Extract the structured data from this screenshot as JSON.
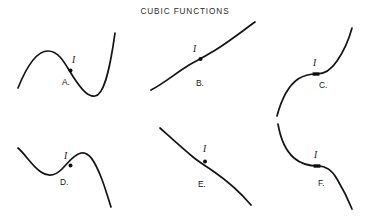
{
  "figure": {
    "title": "CUBIC FUNCTIONS",
    "title_x": 185,
    "title_y": 14,
    "background_color": "#ffffff",
    "stroke_color": "#141414",
    "panel_count": 6
  },
  "panels": [
    {
      "id": "A",
      "label": "A.",
      "label_x": 62,
      "label_y": 85,
      "shape": "cubic-with-local-max-then-local-min-rising-right",
      "path": "M 18,88 C 26,68 36,51 48,51 C 60,51 66,66 74,78 C 82,90 88,97 95,96 C 103,95 109,76 115,33",
      "inflection": {
        "label": "I",
        "label_x": 72,
        "label_y": 63,
        "marker_type": "dot",
        "x": 70.5,
        "y": 70.5,
        "radius": 2.0
      }
    },
    {
      "id": "B",
      "label": "B.",
      "label_x": 196,
      "label_y": 86,
      "shape": "monotonic-increasing-cubic-gentle-s",
      "path": "M 151,90 C 163,84 176,73 189,65 C 196,61 204,57 212,52 C 226,44 241,32 255,22",
      "inflection": {
        "label": "I",
        "label_x": 193,
        "label_y": 52,
        "marker_type": "dot",
        "x": 200.5,
        "y": 59.0,
        "radius": 2.0
      }
    },
    {
      "id": "C",
      "label": "C.",
      "label_x": 319,
      "label_y": 88,
      "shape": "steep-s-curve-flat-inflection-rising",
      "path": "M 277,116 C 281,101 288,86 298,79 C 304,75 310,74 317,74 C 325,74 331,70 337,61 C 344,51 349,39 352,28",
      "inflection": {
        "label": "I",
        "label_x": 313,
        "label_y": 66,
        "marker_type": "tick",
        "x": 316.0,
        "y": 74.0,
        "tick_half_width": 3.4
      }
    },
    {
      "id": "D",
      "label": "D.",
      "label_x": 60,
      "label_y": 185,
      "shape": "cubic-with-local-min-then-local-max-falling-right",
      "path": "M 18,148 C 26,155 32,166 41,172 C 48,177 55,176 62,169 C 68,163 73,155 81,153 C 89,151 95,162 101,177 C 105,187 108,198 111,207",
      "inflection": {
        "label": "I",
        "label_x": 64,
        "label_y": 159,
        "marker_type": "dot",
        "x": 70.5,
        "y": 165.5,
        "radius": 2.0
      }
    },
    {
      "id": "E",
      "label": "E.",
      "label_x": 198,
      "label_y": 187,
      "shape": "monotonic-decreasing-cubic-gentle-s",
      "path": "M 160,128 C 170,137 182,148 193,157 C 199,162 206,166 213,171 C 226,180 240,192 251,205",
      "inflection": {
        "label": "I",
        "label_x": 203,
        "label_y": 152,
        "marker_type": "dot",
        "x": 205.0,
        "y": 161.5,
        "radius": 2.0
      }
    },
    {
      "id": "F",
      "label": "F.",
      "label_x": 318,
      "label_y": 186,
      "shape": "descending-s-curve-flat-inflection",
      "path": "M 278,124 C 280,136 285,150 294,158 C 301,164 310,166 318,166 C 326,166 332,170 337,179 C 343,189 348,199 352,209",
      "inflection": {
        "label": "I",
        "label_x": 314,
        "label_y": 158,
        "marker_type": "tick",
        "x": 317.0,
        "y": 166.0,
        "tick_half_width": 3.4
      }
    }
  ]
}
